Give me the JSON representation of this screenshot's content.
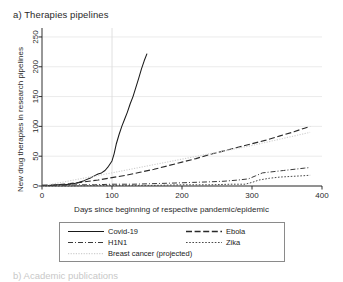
{
  "figure": {
    "panel_label": "a) Therapies pipelines",
    "next_panel_label": "b) Academic publications"
  },
  "chart_data": {
    "type": "line",
    "title": "a) Therapies pipelines",
    "xlabel": "Days since beginning of respective pandemic/epidemic",
    "ylabel": "New drug therapies in research pipelines",
    "xlim": [
      0,
      400
    ],
    "ylim": [
      0,
      260
    ],
    "xticks": [
      0,
      100,
      200,
      300,
      400
    ],
    "yticks": [
      0,
      50,
      100,
      150,
      200,
      250
    ],
    "grid": "horizontal-gridlines-plus-vertical-at-100",
    "legend_position": "below-axes",
    "series": [
      {
        "name": "Covid-19",
        "style": "solid",
        "color": "#1a1a1a",
        "x": [
          0,
          10,
          20,
          30,
          40,
          50,
          60,
          70,
          80,
          85,
          90,
          95,
          100,
          103,
          106,
          110,
          114,
          118,
          122,
          126,
          130,
          134,
          138,
          142,
          146,
          150
        ],
        "y": [
          1,
          1,
          2,
          2,
          3,
          5,
          9,
          14,
          20,
          22,
          26,
          33,
          42,
          54,
          70,
          86,
          100,
          112,
          124,
          138,
          150,
          165,
          180,
          196,
          210,
          222
        ]
      },
      {
        "name": "Ebola",
        "style": "long-dash",
        "color": "#2a2a2a",
        "x": [
          0,
          20,
          40,
          60,
          80,
          100,
          120,
          140,
          160,
          180,
          200,
          220,
          240,
          260,
          280,
          300,
          320,
          340,
          360,
          375,
          383
        ],
        "y": [
          1,
          2,
          4,
          7,
          10,
          14,
          18,
          23,
          28,
          34,
          40,
          46,
          53,
          59,
          65,
          71,
          77,
          84,
          91,
          97,
          100
        ]
      },
      {
        "name": "Breast cancer (projected)",
        "style": "fine-dotted",
        "color": "#cfcfcf",
        "x": [
          0,
          100,
          200,
          300,
          383
        ],
        "y": [
          0,
          22,
          45,
          68,
          90
        ]
      },
      {
        "name": "H1N1",
        "style": "dash-dot",
        "color": "#3a3a3a",
        "x": [
          0,
          25,
          50,
          75,
          100,
          130,
          160,
          190,
          215,
          240,
          260,
          280,
          295,
          305,
          315,
          330,
          345,
          360,
          375,
          383
        ],
        "y": [
          1,
          1,
          2,
          2,
          3,
          3,
          4,
          5,
          6,
          7,
          8,
          10,
          12,
          17,
          22,
          24,
          26,
          28,
          30,
          31
        ]
      },
      {
        "name": "Zika",
        "style": "dotted",
        "color": "#4a4a4a",
        "x": [
          0,
          40,
          80,
          120,
          160,
          200,
          240,
          270,
          290,
          300,
          310,
          325,
          340,
          355,
          370,
          383
        ],
        "y": [
          0,
          0,
          1,
          1,
          1,
          2,
          2,
          3,
          3,
          6,
          10,
          13,
          15,
          16,
          17,
          18
        ]
      }
    ],
    "legend_entries": [
      {
        "label": "Covid-19",
        "style": "solid"
      },
      {
        "label": "Ebola",
        "style": "long-dash"
      },
      {
        "label": "H1N1",
        "style": "dash-dot"
      },
      {
        "label": "Zika",
        "style": "dotted"
      },
      {
        "label": "Breast cancer (projected)",
        "style": "fine-dotted"
      }
    ]
  },
  "axes": {
    "y_title": "New drug therapies in research pipelines",
    "x_title": "Days since beginning of respective pandemic/epidemic",
    "x_tick_labels": [
      "0",
      "100",
      "200",
      "300",
      "400"
    ],
    "y_tick_labels": [
      "0",
      "50",
      "100",
      "150",
      "200",
      "250"
    ]
  }
}
